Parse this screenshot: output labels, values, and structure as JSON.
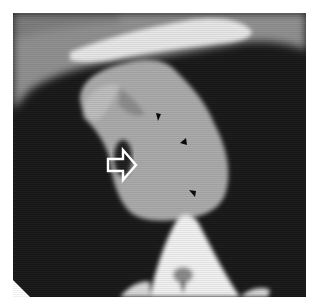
{
  "image": {
    "description": "Axial CT scan of the thorax showing a mediastinal soft-tissue mass, annotated with a white outlined arrow and three black arrowheads",
    "modality": "CT (grayscale)"
  },
  "annotations": {
    "arrow": {
      "type": "outlined-arrow",
      "color": "#ffffff",
      "direction": "right",
      "x": 108,
      "y": 165
    },
    "arrowheads": [
      {
        "type": "arrowhead",
        "color": "#000000",
        "x": 156,
        "y": 117
      },
      {
        "type": "arrowhead",
        "color": "#000000",
        "x": 183,
        "y": 141
      },
      {
        "type": "arrowhead",
        "color": "#000000",
        "x": 192,
        "y": 192
      }
    ]
  },
  "colors": {
    "background": "#ffffff",
    "lung": "#141414",
    "soft_tissue": "#a8a8a8",
    "bone": "#f2f2f2"
  }
}
